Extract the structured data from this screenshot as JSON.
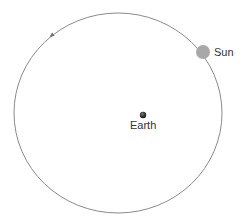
{
  "diagram": {
    "type": "geocentric-orbit",
    "orbit": {
      "cx": 118,
      "cy": 113,
      "rx": 104,
      "ry": 100,
      "stroke": "#8a8a8a",
      "direction": "counterclockwise"
    },
    "bodies": [
      {
        "name": "Sun",
        "label": "Sun",
        "cx": 203,
        "cy": 52,
        "r": 7,
        "color": "#a8a8a8"
      },
      {
        "name": "Earth",
        "label": "Earth",
        "cx": 143,
        "cy": 115,
        "r": 3,
        "color": "#1a1a1a"
      }
    ],
    "arrow": {
      "x": 51,
      "y": 36,
      "color": "#707070"
    }
  },
  "labels": {
    "sun": "Sun",
    "earth": "Earth"
  }
}
